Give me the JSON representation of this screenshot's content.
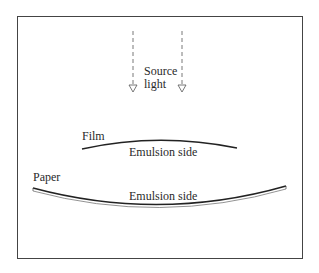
{
  "diagram": {
    "source_label_line1": "Source",
    "source_label_line2": "light",
    "film_label": "Film",
    "film_emulsion_label": "Emulsion side",
    "paper_label": "Paper",
    "paper_emulsion_label": "Emulsion side"
  }
}
